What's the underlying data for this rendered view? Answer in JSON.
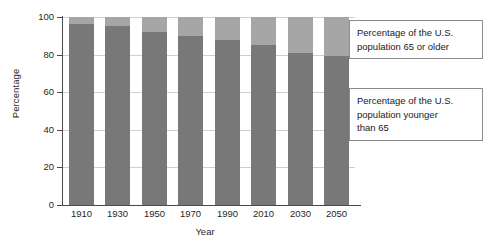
{
  "chart_data": {
    "type": "bar",
    "title": "",
    "subtitle": "",
    "xlabel": "Year",
    "ylabel": "Percentage",
    "categories": [
      "1910",
      "1930",
      "1950",
      "1970",
      "1990",
      "2010",
      "2030",
      "2050"
    ],
    "ylim": [
      0,
      100
    ],
    "yticks": [
      0,
      20,
      40,
      60,
      80,
      100
    ],
    "ytick_labels": [
      "0",
      "20",
      "40",
      "60",
      "80",
      "100"
    ],
    "grid": true,
    "grid_axis": "y",
    "legend_position": "none",
    "stacked": true,
    "series": [
      {
        "name": "Percentage of the U.S. population younger than 65",
        "color": "#787878",
        "values": [
          96.5,
          95.0,
          92.0,
          90.0,
          88.0,
          85.0,
          81.0,
          79.0
        ]
      },
      {
        "name": "Percentage of the U.S. population 65 or older",
        "color": "#a6a6a6",
        "values": [
          3.5,
          5.0,
          8.0,
          10.0,
          12.0,
          15.0,
          19.0,
          21.0
        ]
      }
    ],
    "annotations": [
      {
        "id": "callout-old",
        "text": "Percentage of the U.S. population 65 or older",
        "lines": [
          "Percentage of the U.S.",
          "population 65 or older"
        ],
        "arrow": "left"
      },
      {
        "id": "callout-young",
        "text": "Percentage of the U.S. population younger than 65",
        "lines": [
          "Percentage of the U.S.",
          "population younger",
          "than 65"
        ],
        "arrow": "left"
      }
    ]
  },
  "colors": {
    "younger": "#787878",
    "older": "#a6a6a6",
    "axis": "#4a4a4a",
    "grid": "#cfcfcf",
    "callout_border": "#8c8c8c",
    "background": "#ffffff"
  }
}
